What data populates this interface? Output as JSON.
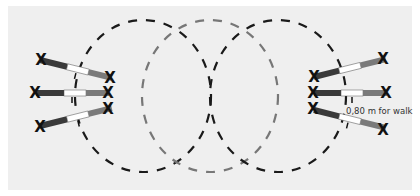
{
  "diagram": {
    "annotation": "0,80 m for walk",
    "colors": {
      "background": "#efefef",
      "circle_outer": "#1a1a1a",
      "circle_middle": "#777777",
      "bar_dark": "#3a3a3a",
      "bar_mid": "#7a7a7a",
      "bar_light": "#ffffff",
      "marker": "#111111"
    },
    "circles": [
      {
        "name": "left-circle",
        "cx": 143,
        "cy": 96,
        "rx": 68,
        "ry": 76
      },
      {
        "name": "middle-circle",
        "cx": 210,
        "cy": 96,
        "rx": 68,
        "ry": 76
      },
      {
        "name": "right-circle",
        "cx": 278,
        "cy": 96,
        "rx": 68,
        "ry": 76
      }
    ],
    "left_bars": 3,
    "right_bars": 3
  }
}
